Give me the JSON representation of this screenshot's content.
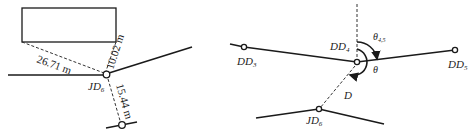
{
  "left_panel": {
    "distances": [
      {
        "value": "26.71 m",
        "target": "building-corner-left"
      },
      {
        "value": "10.02 m",
        "target": "building-corner-right"
      },
      {
        "value": "15.44 m",
        "target": "road-point-below"
      }
    ],
    "node_label": {
      "main": "JD",
      "sub": "6"
    }
  },
  "right_panel": {
    "nodes": [
      {
        "main": "DD",
        "sub": "3"
      },
      {
        "main": "DD",
        "sub": "4"
      },
      {
        "main": "DD",
        "sub": "5"
      },
      {
        "main": "JD",
        "sub": "6"
      }
    ],
    "angles": [
      {
        "main": "θ",
        "sub": "4,5"
      },
      {
        "main": "θ",
        "sub": ""
      }
    ],
    "distance_label": "D"
  }
}
